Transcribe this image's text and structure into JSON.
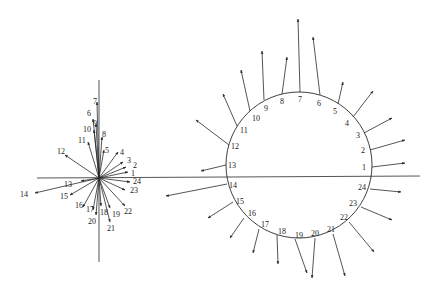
{
  "diagram": {
    "type": "vector-field-comparison",
    "line_color": "#2a2a2a",
    "background": "#ffffff",
    "axes": {
      "horizontal": {
        "x1": 37,
        "y1": 178,
        "x2": 420,
        "y2": 176
      },
      "vertical": {
        "x1": 99,
        "y1": 80,
        "x2": 99,
        "y2": 262
      }
    },
    "star_plot": {
      "origin": [
        99,
        178
      ],
      "vectors": [
        {
          "label": "1",
          "tip": [
            128,
            172
          ],
          "label_pos": [
            131,
            176
          ]
        },
        {
          "label": "2",
          "tip": [
            126,
            167
          ],
          "label_pos": [
            133,
            168
          ]
        },
        {
          "label": "3",
          "tip": [
            123,
            162
          ],
          "label_pos": [
            127,
            163
          ]
        },
        {
          "label": "4",
          "tip": [
            118,
            152
          ],
          "label_pos": [
            120,
            155
          ]
        },
        {
          "label": "5",
          "tip": [
            104,
            150
          ],
          "label_pos": [
            105,
            153
          ]
        },
        {
          "label": "6",
          "tip": [
            93,
            119
          ],
          "label_pos": [
            87,
            116
          ]
        },
        {
          "label": "7",
          "tip": [
            97,
            102
          ],
          "label_pos": [
            93,
            104
          ]
        },
        {
          "label": "8",
          "tip": [
            102,
            137
          ],
          "label_pos": [
            102,
            137
          ]
        },
        {
          "label": "9",
          "tip": [
            96,
            124
          ],
          "label_pos": [
            93,
            126
          ]
        },
        {
          "label": "10",
          "tip": [
            94,
            130
          ],
          "label_pos": [
            83,
            132
          ]
        },
        {
          "label": "11",
          "tip": [
            88,
            142
          ],
          "label_pos": [
            78,
            143
          ]
        },
        {
          "label": "12",
          "tip": [
            65,
            155
          ],
          "label_pos": [
            57,
            154
          ]
        },
        {
          "label": "13",
          "tip": [
            81,
            181
          ],
          "label_pos": [
            64,
            187
          ]
        },
        {
          "label": "14",
          "tip": [
            35,
            193
          ],
          "label_pos": [
            20,
            197
          ]
        },
        {
          "label": "15",
          "tip": [
            70,
            195
          ],
          "label_pos": [
            60,
            199
          ]
        },
        {
          "label": "16",
          "tip": [
            83,
            207
          ],
          "label_pos": [
            75,
            208
          ]
        },
        {
          "label": "17",
          "tip": [
            93,
            210
          ],
          "label_pos": [
            86,
            212
          ]
        },
        {
          "label": "18",
          "tip": [
            101,
            206
          ],
          "label_pos": [
            100,
            215
          ]
        },
        {
          "label": "19",
          "tip": [
            110,
            208
          ],
          "label_pos": [
            112,
            217
          ]
        },
        {
          "label": "20",
          "tip": [
            96,
            215
          ],
          "label_pos": [
            88,
            224
          ]
        },
        {
          "label": "21",
          "tip": [
            110,
            222
          ],
          "label_pos": [
            107,
            231
          ]
        },
        {
          "label": "22",
          "tip": [
            125,
            206
          ],
          "label_pos": [
            124,
            214
          ]
        },
        {
          "label": "23",
          "tip": [
            125,
            190
          ],
          "label_pos": [
            130,
            193
          ]
        },
        {
          "label": "24",
          "tip": [
            130,
            182
          ],
          "label_pos": [
            133,
            184
          ]
        }
      ]
    },
    "circle_plot": {
      "center": [
        299,
        165
      ],
      "radius": 73,
      "vectors": [
        {
          "label": "1",
          "base": [
            372,
            167
          ],
          "tip": [
            405,
            163
          ],
          "label_pos": [
            362,
            170
          ]
        },
        {
          "label": "2",
          "base": [
            370,
            150
          ],
          "tip": [
            405,
            140
          ],
          "label_pos": [
            361,
            153
          ]
        },
        {
          "label": "3",
          "base": [
            364,
            133
          ],
          "tip": [
            392,
            118
          ],
          "label_pos": [
            356,
            138
          ]
        },
        {
          "label": "4",
          "base": [
            353,
            117
          ],
          "tip": [
            373,
            91
          ],
          "label_pos": [
            345,
            126
          ]
        },
        {
          "label": "5",
          "base": [
            338,
            104
          ],
          "tip": [
            343,
            82
          ],
          "label_pos": [
            333,
            114
          ]
        },
        {
          "label": "6",
          "base": [
            320,
            95
          ],
          "tip": [
            313,
            37
          ],
          "label_pos": [
            317,
            106
          ]
        },
        {
          "label": "7",
          "base": [
            300,
            92
          ],
          "tip": [
            298,
            19
          ],
          "label_pos": [
            298,
            102
          ]
        },
        {
          "label": "8",
          "base": [
            282,
            94
          ],
          "tip": [
            287,
            57
          ],
          "label_pos": [
            280,
            104
          ]
        },
        {
          "label": "9",
          "base": [
            264,
            100
          ],
          "tip": [
            262,
            51
          ],
          "label_pos": [
            264,
            111
          ]
        },
        {
          "label": "10",
          "base": [
            250,
            111
          ],
          "tip": [
            241,
            70
          ],
          "label_pos": [
            252,
            121
          ]
        },
        {
          "label": "11",
          "base": [
            237,
            126
          ],
          "tip": [
            223,
            94
          ],
          "label_pos": [
            240,
            133
          ]
        },
        {
          "label": "12",
          "base": [
            229,
            145
          ],
          "tip": [
            196,
            120
          ],
          "label_pos": [
            231,
            149
          ]
        },
        {
          "label": "13",
          "base": [
            226,
            165
          ],
          "tip": [
            201,
            171
          ],
          "label_pos": [
            228,
            168
          ]
        },
        {
          "label": "14",
          "base": [
            227,
            184
          ],
          "tip": [
            166,
            196
          ],
          "label_pos": [
            229,
            188
          ]
        },
        {
          "label": "15",
          "base": [
            233,
            202
          ],
          "tip": [
            208,
            218
          ],
          "label_pos": [
            236,
            204
          ]
        },
        {
          "label": "16",
          "base": [
            244,
            218
          ],
          "tip": [
            230,
            238
          ],
          "label_pos": [
            248,
            216
          ]
        },
        {
          "label": "17",
          "base": [
            259,
            229
          ],
          "tip": [
            253,
            253
          ],
          "label_pos": [
            261,
            227
          ]
        },
        {
          "label": "18",
          "base": [
            277,
            235
          ],
          "tip": [
            278,
            264
          ],
          "label_pos": [
            278,
            234
          ]
        },
        {
          "label": "19",
          "base": [
            295,
            239
          ],
          "tip": [
            307,
            273
          ],
          "label_pos": [
            295,
            238
          ]
        },
        {
          "label": "20",
          "base": [
            315,
            238
          ],
          "tip": [
            312,
            278
          ],
          "label_pos": [
            311,
            236
          ]
        },
        {
          "label": "21",
          "base": [
            333,
            234
          ],
          "tip": [
            345,
            276
          ],
          "label_pos": [
            327,
            232
          ]
        },
        {
          "label": "22",
          "base": [
            349,
            222
          ],
          "tip": [
            374,
            252
          ],
          "label_pos": [
            340,
            220
          ]
        },
        {
          "label": "23",
          "base": [
            361,
            207
          ],
          "tip": [
            392,
            220
          ],
          "label_pos": [
            349,
            206
          ]
        },
        {
          "label": "24",
          "base": [
            370,
            189
          ],
          "tip": [
            401,
            192
          ],
          "label_pos": [
            358,
            190
          ]
        }
      ]
    }
  }
}
